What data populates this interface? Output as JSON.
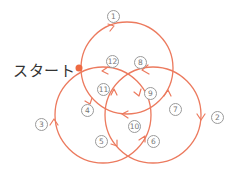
{
  "start_label": "スタート",
  "colors": {
    "stroke": "#ec7a5e",
    "start_dot": "#ee6a42",
    "label_text": "#333333",
    "number_text": "#777777"
  },
  "circles": [
    {
      "name": "top",
      "cx": 127,
      "cy": 68,
      "r": 46
    },
    {
      "name": "left",
      "cx": 103,
      "cy": 115,
      "r": 48
    },
    {
      "name": "right",
      "cx": 153,
      "cy": 115,
      "r": 48
    }
  ],
  "steps": [
    {
      "n": "1",
      "label": "①",
      "x": 107,
      "y": 10
    },
    {
      "n": "2",
      "label": "②",
      "x": 211,
      "y": 111
    },
    {
      "n": "3",
      "label": "③",
      "x": 35,
      "y": 118
    },
    {
      "n": "4",
      "label": "④",
      "x": 81,
      "y": 104
    },
    {
      "n": "5",
      "label": "⑤",
      "x": 95,
      "y": 135
    },
    {
      "n": "6",
      "label": "⑥",
      "x": 147,
      "y": 135
    },
    {
      "n": "7",
      "label": "⑦",
      "x": 169,
      "y": 103
    },
    {
      "n": "8",
      "label": "⑧",
      "x": 134,
      "y": 56
    },
    {
      "n": "9",
      "label": "⑨",
      "x": 144,
      "y": 87
    },
    {
      "n": "10",
      "label": "⑩",
      "x": 128,
      "y": 120
    },
    {
      "n": "11",
      "label": "⑪",
      "x": 97,
      "y": 83
    },
    {
      "n": "12",
      "label": "⑫",
      "x": 106,
      "y": 55
    }
  ]
}
